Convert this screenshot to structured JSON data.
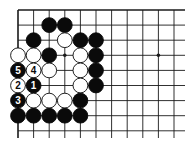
{
  "board": {
    "cols": 11,
    "rows": 9,
    "origin_x": 18,
    "origin_y": 10,
    "spacing_x": 15.6,
    "spacing_y": 15.1,
    "line_extend_right": 185,
    "line_extend_bottom": 138,
    "top_edge": true,
    "left_edge": true,
    "stone_radius": 7.4,
    "colors": {
      "line": "#1a1a1a",
      "black": "#0a0a0a",
      "white": "#ffffff",
      "background": "#ffffff"
    }
  },
  "hoshi": [
    {
      "col": 3,
      "row": 3
    },
    {
      "col": 9,
      "row": 3
    }
  ],
  "stones": [
    {
      "col": 2,
      "row": 1,
      "color": "black"
    },
    {
      "col": 3,
      "row": 1,
      "color": "black"
    },
    {
      "col": 1,
      "row": 2,
      "color": "black"
    },
    {
      "col": 3,
      "row": 2,
      "color": "white"
    },
    {
      "col": 4,
      "row": 2,
      "color": "black"
    },
    {
      "col": 5,
      "row": 2,
      "color": "black"
    },
    {
      "col": 0,
      "row": 3,
      "color": "white"
    },
    {
      "col": 1,
      "row": 3,
      "color": "white"
    },
    {
      "col": 2,
      "row": 3,
      "color": "black"
    },
    {
      "col": 4,
      "row": 3,
      "color": "white"
    },
    {
      "col": 5,
      "row": 3,
      "color": "black"
    },
    {
      "col": 0,
      "row": 4,
      "color": "black",
      "label": "5"
    },
    {
      "col": 1,
      "row": 4,
      "color": "white",
      "label": "4"
    },
    {
      "col": 2,
      "row": 4,
      "color": "white"
    },
    {
      "col": 4,
      "row": 4,
      "color": "white"
    },
    {
      "col": 5,
      "row": 4,
      "color": "black"
    },
    {
      "col": 0,
      "row": 5,
      "color": "white",
      "label": "2"
    },
    {
      "col": 1,
      "row": 5,
      "color": "black",
      "label": "1"
    },
    {
      "col": 4,
      "row": 5,
      "color": "white"
    },
    {
      "col": 5,
      "row": 5,
      "color": "black"
    },
    {
      "col": 0,
      "row": 6,
      "color": "black",
      "label": "3"
    },
    {
      "col": 1,
      "row": 6,
      "color": "white"
    },
    {
      "col": 2,
      "row": 6,
      "color": "white"
    },
    {
      "col": 3,
      "row": 6,
      "color": "white"
    },
    {
      "col": 4,
      "row": 6,
      "color": "black"
    },
    {
      "col": 0,
      "row": 7,
      "color": "black"
    },
    {
      "col": 1,
      "row": 7,
      "color": "black"
    },
    {
      "col": 2,
      "row": 7,
      "color": "black"
    },
    {
      "col": 3,
      "row": 7,
      "color": "black"
    },
    {
      "col": 4,
      "row": 7,
      "color": "black"
    }
  ]
}
